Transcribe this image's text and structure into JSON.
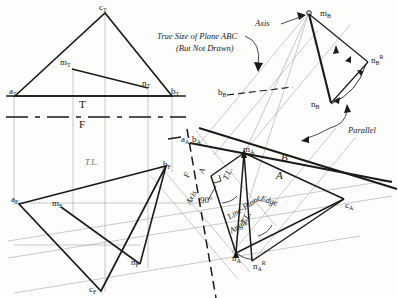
{
  "drawing": {
    "title": "Descriptive Geometry: Line-Plane Angle Construction",
    "ink_color": "#1a1a1a",
    "light_color": "#9a9a9a",
    "annotations": {
      "true_size_line1": "True Size of Plane ABC",
      "true_size_line2": "(But Not Drawn)",
      "axis_top": "Axis",
      "axis_mid": "Axis",
      "parallel": "Parallel",
      "edge": "Edge",
      "line_plane_1": "Line-Plane",
      "line_plane_2": "Angle",
      "angle_90": "90°",
      "tl_front": "T.L.",
      "tl_aux_a": "T.L.",
      "tl_aux_b": "T.L."
    },
    "fold_lines": {
      "tf_top": "T",
      "tf_bottom": "F",
      "fa_left": "F",
      "fa_right": "A",
      "ab_top": "B",
      "ab_bottom": "A"
    },
    "points": {
      "top_view": [
        {
          "label": "a",
          "sub": "T",
          "x": 9,
          "y": 87
        },
        {
          "label": "b",
          "sub": "T",
          "x": 171,
          "y": 87
        },
        {
          "label": "c",
          "sub": "T",
          "x": 99,
          "y": 3
        },
        {
          "label": "m",
          "sub": "T",
          "x": 60,
          "y": 58
        },
        {
          "label": "n",
          "sub": "T",
          "x": 142,
          "y": 79
        }
      ],
      "front_view": [
        {
          "label": "a",
          "sub": "F",
          "x": 11,
          "y": 195
        },
        {
          "label": "b",
          "sub": "F",
          "x": 163,
          "y": 160
        },
        {
          "label": "c",
          "sub": "F",
          "x": 89,
          "y": 285
        },
        {
          "label": "m",
          "sub": "F",
          "x": 52,
          "y": 199
        },
        {
          "label": "n",
          "sub": "F",
          "x": 131,
          "y": 258
        }
      ],
      "aux_a": [
        {
          "label": "a",
          "sub": "A",
          "x": 181,
          "y": 135
        },
        {
          "label": "b",
          "sub": "A",
          "x": 192,
          "y": 135
        },
        {
          "label": "c",
          "sub": "A",
          "x": 345,
          "y": 201
        },
        {
          "label": "m",
          "sub": "A",
          "x": 243,
          "y": 145
        },
        {
          "label": "n",
          "sub": "A",
          "x": 232,
          "y": 254
        },
        {
          "label": "n",
          "sub": "A",
          "sup": "R",
          "x": 253,
          "y": 262
        }
      ],
      "aux_b": [
        {
          "label": "b",
          "sub": "B",
          "x": 218,
          "y": 88
        },
        {
          "label": "m",
          "sub": "B",
          "x": 320,
          "y": 9
        },
        {
          "label": "n",
          "sub": "B",
          "x": 311,
          "y": 100
        },
        {
          "label": "n",
          "sub": "B",
          "sup": "R",
          "x": 371,
          "y": 56
        }
      ]
    }
  }
}
